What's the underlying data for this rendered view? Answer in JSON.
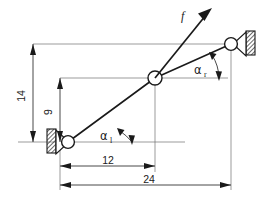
{
  "diagram": {
    "type": "engineering-sketch",
    "background_color": "#ffffff",
    "line_color": "#1a1a1a",
    "thin_line_color": "#707070",
    "labels": {
      "force": "f",
      "angle_left": "α",
      "angle_left_subscript": "l",
      "angle_right": "α",
      "angle_right_subscript": "r"
    },
    "dimensions": [
      {
        "name": "vertical-total",
        "value": "14",
        "orientation": "vertical"
      },
      {
        "name": "vertical-mid",
        "value": "9",
        "orientation": "vertical"
      },
      {
        "name": "horizontal-mid",
        "value": "12",
        "orientation": "horizontal"
      },
      {
        "name": "horizontal-total",
        "value": "24",
        "orientation": "horizontal"
      }
    ],
    "nodes": [
      {
        "name": "left-pin-support",
        "x": 68,
        "y": 142
      },
      {
        "name": "center-joint",
        "x": 155,
        "y": 78
      },
      {
        "name": "right-pin-support",
        "x": 231,
        "y": 44
      }
    ],
    "force_vector": {
      "origin_x": 155,
      "origin_y": 78,
      "tip_x": 212,
      "tip_y": 8
    }
  }
}
